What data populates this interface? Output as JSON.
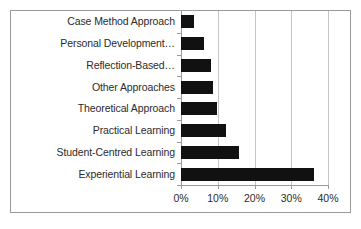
{
  "chart_data": {
    "type": "bar",
    "orientation": "horizontal",
    "title": "",
    "subtitle": "",
    "xlabel": "",
    "ylabel": "",
    "xlim": [
      0,
      40
    ],
    "xticks": [
      "0%",
      "10%",
      "20%",
      "30%",
      "40%"
    ],
    "xtick_values": [
      0,
      10,
      20,
      30,
      40
    ],
    "grid": true,
    "legend": false,
    "legend_position": "none",
    "bar_color": "#111111",
    "grid_color": "#c4c4c4",
    "axis_color": "#9a9a9a",
    "border_color": "#9a9a9a",
    "background_color": "#ffffff",
    "categories": [
      "Case Method Approach",
      "Personal Development…",
      "Reflection-Based…",
      "Other Approaches",
      "Theoretical Approach",
      "Practical Learning",
      "Student-Centred Learning",
      "Experiential Learning"
    ],
    "values": [
      3.5,
      6.3,
      8.2,
      8.7,
      9.8,
      12.2,
      15.8,
      36.3
    ],
    "value_unit": "%"
  }
}
